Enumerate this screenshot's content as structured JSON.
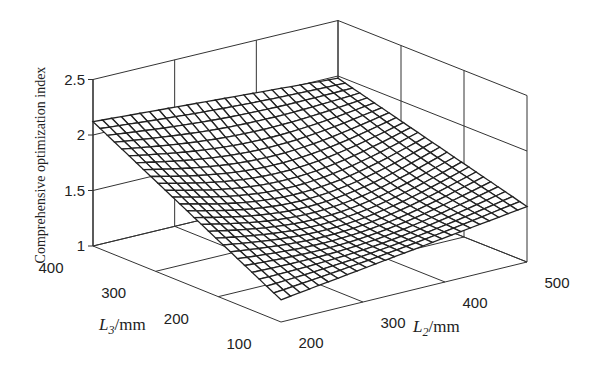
{
  "chart_data": {
    "type": "surface",
    "title": "",
    "zlabel": "Comprehensive optimization index",
    "xlabel": "L2/mm",
    "xlabel_main": "L",
    "xlabel_sub": "2",
    "xlabel_unit": "/mm",
    "ylabel": "L3/mm",
    "ylabel_main": "L",
    "ylabel_sub": "3",
    "ylabel_unit": "/mm",
    "x_ticks": [
      "200",
      "300",
      "400",
      "500"
    ],
    "y_ticks": [
      "100",
      "200",
      "300",
      "400"
    ],
    "z_ticks": [
      "1",
      "1.5",
      "2",
      "2.5"
    ],
    "xlim": [
      200,
      500
    ],
    "ylim": [
      100,
      400
    ],
    "zlim": [
      1,
      2.5
    ],
    "grid": true,
    "corner_values": {
      "L2_200_L3_400": 2.12,
      "L2_500_L3_400": 1.98,
      "L2_200_L3_100": 1.2,
      "L2_500_L3_100": 1.5
    },
    "surface_grid_size": 26,
    "line_color": "#222222",
    "face_color": "#ffffff"
  }
}
